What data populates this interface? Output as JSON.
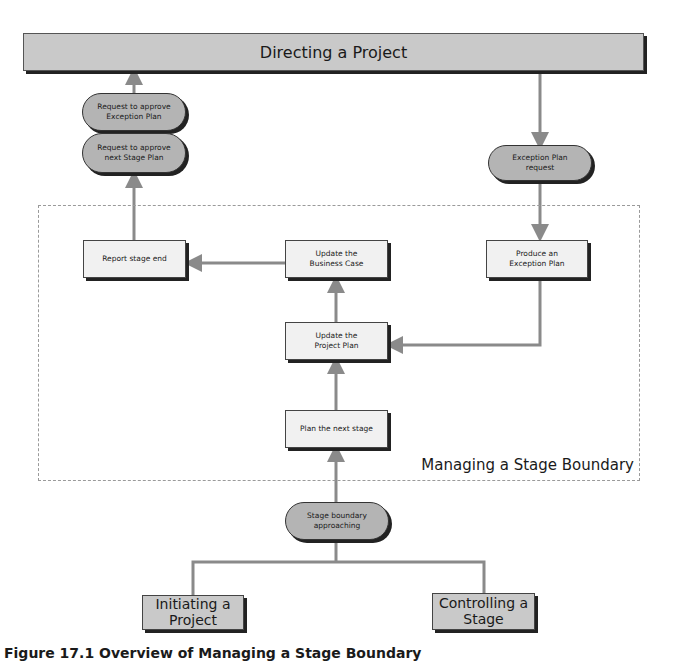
{
  "diagram": {
    "top_process": "Directing a Project",
    "boundary_label": "Managing a Stage Boundary",
    "caption": "Figure 17.1 Overview of Managing a Stage Boundary",
    "events": {
      "request_exception_plan": [
        "Request to approve",
        "Exception Plan"
      ],
      "request_next_stage_plan": [
        "Request to approve",
        "next Stage Plan"
      ],
      "exception_plan_request": [
        "Exception Plan",
        "request"
      ],
      "stage_boundary_approaching": [
        "Stage boundary",
        "approaching"
      ]
    },
    "activities": {
      "report_stage_end": [
        "Report stage end"
      ],
      "update_business_case": [
        "Update the",
        "Business Case"
      ],
      "produce_exception_plan": [
        "Produce an",
        "Exception Plan"
      ],
      "update_project_plan": [
        "Update the",
        "Project Plan"
      ],
      "plan_next_stage": [
        "Plan the next stage"
      ]
    },
    "external_processes": {
      "initiating": [
        "Initiating a",
        "Project"
      ],
      "controlling": [
        "Controlling a",
        "Stage"
      ]
    },
    "colors": {
      "process_fill": "#c9c9c9",
      "event_fill": "#b4b4b4",
      "activity_fill": "#f1f1f1",
      "connector": "#8a8a8a",
      "shadow": "#222222"
    }
  }
}
